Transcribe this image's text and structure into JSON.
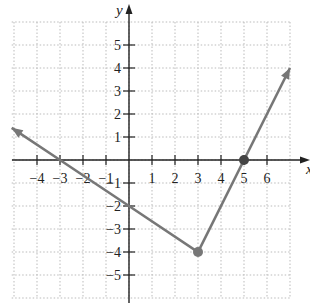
{
  "chart_data": {
    "type": "line",
    "title": "",
    "xlabel": "x",
    "ylabel": "y",
    "xlim": [
      -5.1,
      7
    ],
    "ylim": [
      -6,
      6
    ],
    "grid": true,
    "x_ticks": [
      -4,
      -3,
      -2,
      -1,
      1,
      2,
      3,
      4,
      5,
      6
    ],
    "y_ticks": [
      5,
      4,
      3,
      2,
      1,
      -1,
      -2,
      -3,
      -4,
      -5
    ],
    "series": [
      {
        "name": "piecewise-linear V graph",
        "x": [
          -5.1,
          -3,
          0,
          3,
          5,
          7
        ],
        "y": [
          1.4,
          0,
          -2,
          -4,
          0,
          4
        ],
        "arrows": "both ends"
      }
    ],
    "points": [
      {
        "x": 3,
        "y": -4,
        "label": "vertex"
      },
      {
        "x": 5,
        "y": 0,
        "label": "x-intercept"
      }
    ],
    "colors": {
      "line": "#777777",
      "axis": "#222222",
      "grid": "#bbbbbb"
    }
  }
}
